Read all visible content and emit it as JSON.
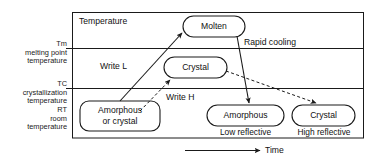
{
  "diagram": {
    "title_label": "Temperature",
    "time_axis_label": "Time",
    "temperature_levels": [
      {
        "symbol": "Tm",
        "description_line1": "melting point",
        "description_line2": "temperature"
      },
      {
        "symbol": "TC",
        "description_line1": "crystallization",
        "description_line2": "temperature"
      },
      {
        "symbol": "RT",
        "description_line1": "room",
        "description_line2": "temperature"
      }
    ],
    "nodes": [
      {
        "id": "molten",
        "label": "Molten"
      },
      {
        "id": "crystal_mid",
        "label": "Crystal"
      },
      {
        "id": "start",
        "label_line1": "Amorphous",
        "label_line2": "or crystal"
      },
      {
        "id": "amorphous_end",
        "label": "Amorphous",
        "sublabel": "Low reflective"
      },
      {
        "id": "crystal_end",
        "label": "Crystal",
        "sublabel": "High reflective"
      }
    ],
    "process_labels": [
      {
        "id": "write-l",
        "text": "Write L"
      },
      {
        "id": "write-h",
        "text": "Write H"
      },
      {
        "id": "rapid-cooling",
        "text": "Rapid cooling"
      }
    ],
    "colors": {
      "line": "#1a1a1a",
      "background": "#ffffff",
      "text": "#111111"
    }
  }
}
